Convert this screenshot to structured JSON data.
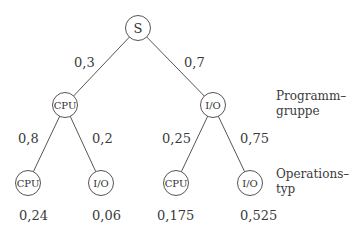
{
  "tree": {
    "root": {
      "label": "S"
    },
    "level1": [
      {
        "label": "CPU",
        "edge_prob": "0,3"
      },
      {
        "label": "I/O",
        "edge_prob": "0,7"
      }
    ],
    "level2": [
      {
        "label": "CPU",
        "edge_prob": "0,8",
        "result": "0,24"
      },
      {
        "label": "I/O",
        "edge_prob": "0,2",
        "result": "0,06"
      },
      {
        "label": "CPU",
        "edge_prob": "0,25",
        "result": "0,175"
      },
      {
        "label": "I/O",
        "edge_prob": "0,75",
        "result": "0,525"
      }
    ]
  },
  "side_labels": {
    "level1": [
      "Programm–",
      "gruppe"
    ],
    "level2": [
      "Operations–",
      "typ"
    ]
  }
}
